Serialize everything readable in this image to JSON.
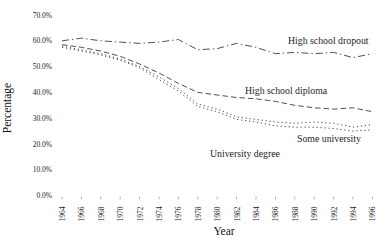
{
  "chart_data": {
    "type": "line",
    "title": "",
    "xlabel": "Year",
    "ylabel": "Percentage",
    "x": [
      1964,
      1966,
      1968,
      1970,
      1972,
      1974,
      1976,
      1978,
      1980,
      1982,
      1984,
      1986,
      1988,
      1990,
      1992,
      1994,
      1996
    ],
    "x_tick_labels": [
      "1964",
      "1966",
      "1968",
      "1970",
      "1972",
      "1974",
      "1976",
      "1978",
      "1980",
      "1982",
      "1984",
      "1986",
      "1988",
      "1990",
      "1992",
      "1994",
      "1996"
    ],
    "y_ticks": [
      0,
      10,
      20,
      30,
      40,
      50,
      60,
      70
    ],
    "y_tick_labels": [
      "0.0%",
      "10.0%",
      "20.0%",
      "30.0%",
      "40.0%",
      "50.0%",
      "60.0%",
      "70.0%"
    ],
    "ylim": [
      0,
      70
    ],
    "grid": false,
    "legend_position": "inline-annotations",
    "line_color": "#3c3c3c",
    "series": [
      {
        "name": "High school dropout",
        "style": "dashdot",
        "values": [
          60.0,
          61.0,
          60.0,
          59.5,
          59.0,
          59.5,
          60.5,
          56.5,
          57.0,
          59.0,
          57.5,
          55.0,
          55.5,
          55.0,
          55.5,
          53.5,
          55.0
        ]
      },
      {
        "name": "High school diploma",
        "style": "dashed",
        "values": [
          58.5,
          57.5,
          56.0,
          54.0,
          51.0,
          47.5,
          43.5,
          40.0,
          39.0,
          38.0,
          37.5,
          36.5,
          35.0,
          34.0,
          33.5,
          34.0,
          32.5
        ]
      },
      {
        "name": "Some university",
        "style": "dotted",
        "values": [
          58.0,
          56.5,
          55.0,
          53.0,
          50.0,
          46.0,
          41.5,
          35.5,
          33.5,
          30.5,
          29.5,
          28.5,
          28.0,
          28.5,
          28.0,
          26.5,
          27.5
        ]
      },
      {
        "name": "University degree",
        "style": "dotted",
        "values": [
          57.5,
          56.0,
          54.5,
          52.5,
          49.5,
          45.0,
          40.5,
          34.5,
          32.5,
          29.5,
          28.5,
          27.0,
          26.5,
          26.5,
          26.0,
          25.0,
          25.5
        ]
      }
    ],
    "annotations": [
      {
        "text": "High school dropout",
        "x": 288,
        "y": 44
      },
      {
        "text": "High school diploma",
        "x": 245,
        "y": 94
      },
      {
        "text": "Some university",
        "x": 297,
        "y": 142
      },
      {
        "text": "University degree",
        "x": 210,
        "y": 157
      }
    ]
  }
}
